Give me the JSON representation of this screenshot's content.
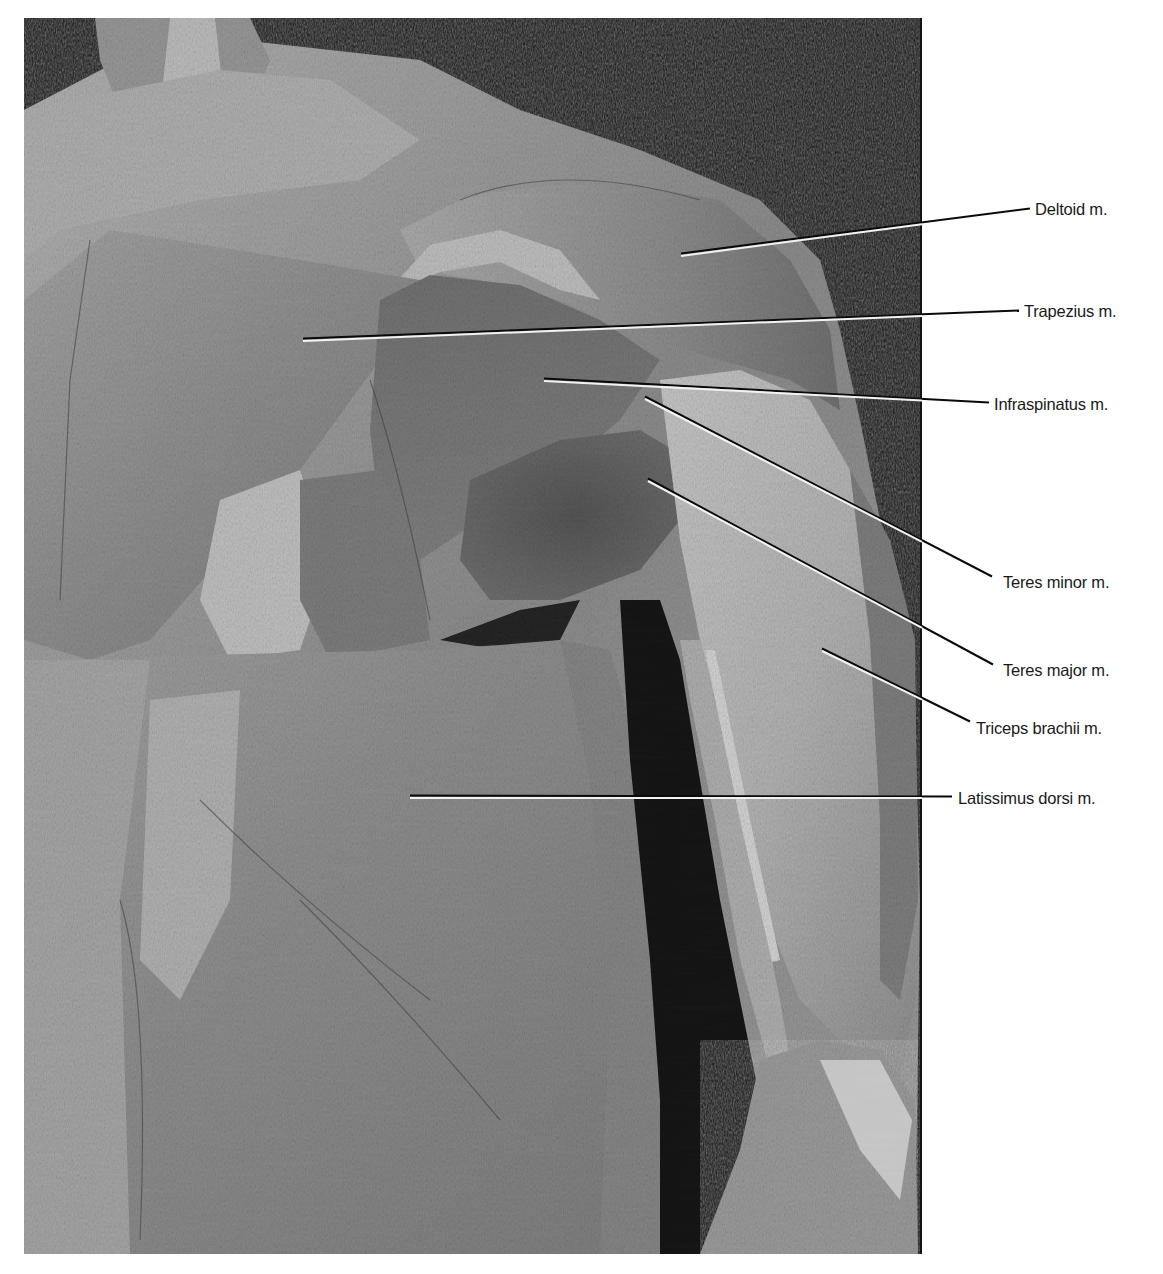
{
  "figure": {
    "photo_box": {
      "x": 24,
      "y": 18,
      "w": 898,
      "h": 1236
    },
    "description_hidden": "Posterior view of shoulder dissection",
    "colors": {
      "background": "#ffffff",
      "photo_black": "#050505",
      "muscle_mid": "#8a8a8a",
      "muscle_light": "#c9c9c9",
      "muscle_dark": "#5a5a5a",
      "leader_white": "#f2f2f2",
      "leader_black": "#0a0a0a",
      "label_text": "#1a1a1a"
    }
  },
  "labels": [
    {
      "id": "deltoid",
      "text": "Deltoid m.",
      "x": 1035,
      "y": 209,
      "line": {
        "x1": 681,
        "y1": 255,
        "x2": 1030,
        "y2": 209
      }
    },
    {
      "id": "trapezius",
      "text": "Trapezius m.",
      "x": 1024,
      "y": 311,
      "line": {
        "x1": 303,
        "y1": 340,
        "x2": 1019,
        "y2": 311
      }
    },
    {
      "id": "infraspinatus",
      "text": "Infraspinatus m.",
      "x": 994,
      "y": 404,
      "line": {
        "x1": 544,
        "y1": 380,
        "x2": 989,
        "y2": 403
      }
    },
    {
      "id": "teres-minor",
      "text": "Teres minor m.",
      "x": 1003,
      "y": 582,
      "line": {
        "x1": 645,
        "y1": 398,
        "x2": 992,
        "y2": 577
      }
    },
    {
      "id": "teres-major",
      "text": "Teres major m.",
      "x": 1003,
      "y": 670,
      "line": {
        "x1": 648,
        "y1": 480,
        "x2": 993,
        "y2": 665
      }
    },
    {
      "id": "triceps-brachii",
      "text": "Triceps brachii m.",
      "x": 976,
      "y": 728,
      "line": {
        "x1": 822,
        "y1": 650,
        "x2": 970,
        "y2": 722
      }
    },
    {
      "id": "latissimus-dorsi",
      "text": "Latissimus dorsi m.",
      "x": 958,
      "y": 798,
      "line": {
        "x1": 410,
        "y1": 797,
        "x2": 952,
        "y2": 797
      }
    }
  ]
}
